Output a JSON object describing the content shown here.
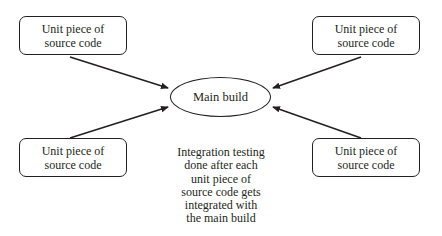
{
  "diagram": {
    "center_node": {
      "label": "Main build"
    },
    "unit_nodes": [
      {
        "position": "top-left",
        "line1": "Unit piece of",
        "line2": "source code"
      },
      {
        "position": "top-right",
        "line1": "Unit piece of",
        "line2": "source code"
      },
      {
        "position": "bottom-left",
        "line1": "Unit piece of",
        "line2": "source code"
      },
      {
        "position": "bottom-right",
        "line1": "Unit piece of",
        "line2": "source code"
      }
    ],
    "edges": [
      {
        "from": "top-left",
        "to": "Main build"
      },
      {
        "from": "top-right",
        "to": "Main build"
      },
      {
        "from": "bottom-left",
        "to": "Main build"
      },
      {
        "from": "bottom-right",
        "to": "Main build"
      }
    ],
    "caption": {
      "lines": [
        "Integration testing",
        "done after each",
        "unit piece of",
        "source code gets",
        "integrated with",
        "the main build"
      ]
    },
    "colors": {
      "stroke": "#231f20",
      "background": "#ffffff"
    }
  }
}
